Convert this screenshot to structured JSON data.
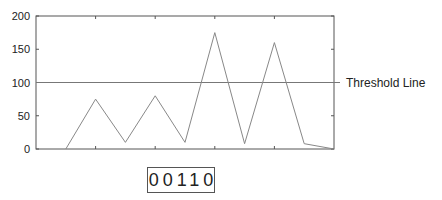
{
  "chart_data": {
    "type": "line",
    "title": "",
    "xlabel": "",
    "ylabel": "",
    "x": [
      1,
      2,
      3,
      4,
      5,
      6,
      7,
      8,
      9,
      10
    ],
    "series": [
      {
        "name": "signal",
        "values": [
          0,
          75,
          10,
          80,
          10,
          175,
          8,
          160,
          8,
          0
        ]
      }
    ],
    "xlim": [
      0,
      10
    ],
    "ylim": [
      0,
      200
    ],
    "yticks": [
      0,
      50,
      100,
      150,
      200
    ],
    "xtick_labels": [],
    "grid": false,
    "threshold": {
      "value": 100,
      "label": "Threshold Line"
    }
  },
  "counter": {
    "value": "00110"
  }
}
